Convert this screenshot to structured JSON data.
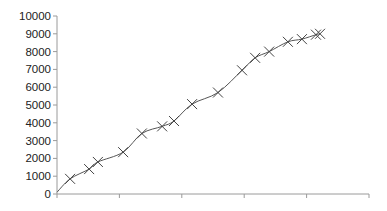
{
  "chart_data": {
    "type": "line",
    "title": "",
    "xlabel": "",
    "ylabel": "",
    "ylim": [
      0,
      10000
    ],
    "xlim": [
      0,
      100
    ],
    "grid": false,
    "legend": null,
    "y_ticks": [
      0,
      1000,
      2000,
      3000,
      4000,
      5000,
      6000,
      7000,
      8000,
      9000,
      10000
    ],
    "y_tick_labels": [
      "0",
      "1000",
      "2000",
      "3000",
      "4000",
      "5000",
      "6000",
      "7000",
      "8000",
      "9000",
      "10000"
    ],
    "x_ticks": [
      0,
      20,
      40,
      60,
      80,
      100
    ],
    "x_tick_labels": [
      "",
      "",
      "",
      "",
      "",
      ""
    ],
    "line_start": {
      "x": 0,
      "y": 100
    },
    "series": [
      {
        "name": "Series 1",
        "marker": "x",
        "color": "#555555",
        "x": [
          4.2,
          10.3,
          13.1,
          21.2,
          27.2,
          33.7,
          37.5,
          43.3,
          51.6,
          59.3,
          63.5,
          68.0,
          74.0,
          78.5,
          83.0,
          84.3
        ],
        "values": [
          850,
          1400,
          1800,
          2350,
          3400,
          3800,
          4100,
          5050,
          5700,
          6950,
          7650,
          8000,
          8550,
          8700,
          8950,
          9000
        ]
      }
    ]
  },
  "colors": {
    "axis": "#9a9a9a",
    "line": "#555555",
    "marker": "#444444",
    "text": "#222222"
  }
}
